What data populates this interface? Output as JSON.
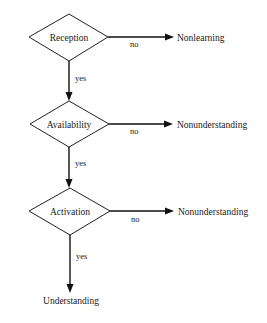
{
  "diagram": {
    "type": "flowchart",
    "nodes": [
      {
        "id": "reception",
        "label": "Reception",
        "shape": "diamond"
      },
      {
        "id": "availability",
        "label": "Availability",
        "shape": "diamond"
      },
      {
        "id": "activation",
        "label": "Activation",
        "shape": "diamond"
      }
    ],
    "outcomes": {
      "nonlearning": "Nonlearning",
      "nonunderstanding_1": "Nonunderstanding",
      "nonunderstanding_2": "Nonunderstanding",
      "understanding": "Understanding"
    },
    "edges": [
      {
        "from": "reception",
        "to": "nonlearning",
        "label": "no"
      },
      {
        "from": "reception",
        "to": "availability",
        "label": "yes"
      },
      {
        "from": "availability",
        "to": "nonunderstanding_1",
        "label": "no"
      },
      {
        "from": "availability",
        "to": "activation",
        "label": "yes"
      },
      {
        "from": "activation",
        "to": "nonunderstanding_2",
        "label": "no"
      },
      {
        "from": "activation",
        "to": "understanding",
        "label": "yes"
      }
    ]
  }
}
